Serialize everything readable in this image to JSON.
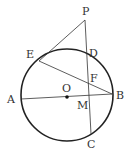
{
  "diagram": {
    "type": "geometry",
    "circle": {
      "center": "O",
      "cx": 67,
      "cy": 95,
      "r": 46
    },
    "points": {
      "P": {
        "x": 85,
        "y": 20,
        "label": "P",
        "lx": 82,
        "ly": 15
      },
      "D": {
        "x": 86,
        "y": 50,
        "label": "D",
        "lx": 89,
        "ly": 57
      },
      "E": {
        "x": 39,
        "y": 61,
        "label": "E",
        "lx": 26,
        "ly": 58
      },
      "F": {
        "x": 87,
        "y": 80,
        "label": "F",
        "lx": 90,
        "ly": 82
      },
      "A": {
        "x": 21,
        "y": 99,
        "label": "A",
        "lx": 7,
        "ly": 103
      },
      "O": {
        "x": 67,
        "y": 97,
        "label": "O",
        "lx": 62,
        "ly": 92
      },
      "M": {
        "x": 88,
        "y": 95,
        "label": "M",
        "lx": 77,
        "ly": 109
      },
      "B": {
        "x": 112,
        "y": 94,
        "label": "B",
        "lx": 116,
        "ly": 99
      },
      "C": {
        "x": 91,
        "y": 134,
        "label": "C",
        "lx": 87,
        "ly": 148
      }
    },
    "segments": [
      [
        "P",
        "E"
      ],
      [
        "P",
        "C"
      ],
      [
        "E",
        "B"
      ],
      [
        "A",
        "B"
      ]
    ],
    "colors": {
      "stroke": "#333333",
      "circle": "#222222"
    }
  }
}
